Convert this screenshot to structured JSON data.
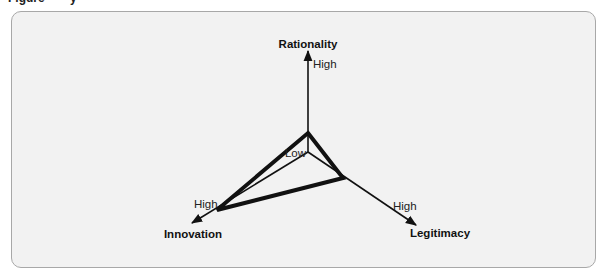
{
  "figure": {
    "caption_partial": "Figure · · · y",
    "background_color": "#f2f2f2",
    "border_color": "#a8a8a8",
    "line_color": "#111111"
  },
  "diagram": {
    "type": "three-axis radar (triangle plot)",
    "origin_label": "Low",
    "axes": [
      {
        "id": "rationality",
        "title": "Rationality",
        "high_label": "High",
        "direction": "up"
      },
      {
        "id": "innovation",
        "title": "Innovation",
        "high_label": "High",
        "direction": "down-left"
      },
      {
        "id": "legitimacy",
        "title": "Legitimacy",
        "high_label": "High",
        "direction": "down-right"
      }
    ],
    "profiles": [
      {
        "name": "thick-profile",
        "stroke_width": 4,
        "values": {
          "rationality": "low",
          "innovation": "high",
          "legitimacy": "medium-low"
        }
      },
      {
        "name": "thin-spokes",
        "stroke_width": 1.5,
        "note": "thin lines from origin to the thick profile's Innovation and Legitimacy vertices"
      }
    ]
  }
}
